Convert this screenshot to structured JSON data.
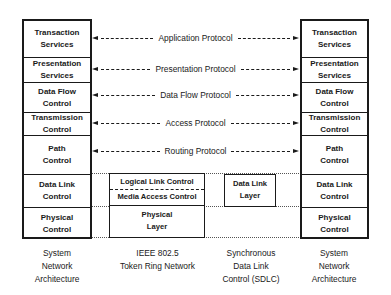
{
  "left_stack": {
    "layers": [
      {
        "label": "Transaction\nServices"
      },
      {
        "label": "Presentation\nServices"
      },
      {
        "label": "Data Flow\nControl"
      },
      {
        "label": "Transmission\nControl"
      },
      {
        "label": "Path\nControl"
      },
      {
        "label": "Data Link\nControl"
      },
      {
        "label": "Physical\nControl"
      }
    ],
    "caption": "System\nNetwork\nArchitecture"
  },
  "right_stack": {
    "layers": [
      {
        "label": "Transaction\nServices"
      },
      {
        "label": "Presentation\nServices"
      },
      {
        "label": "Data Flow\nControl"
      },
      {
        "label": "Transmission\nControl"
      },
      {
        "label": "Path\nControl"
      },
      {
        "label": "Data Link\nControl"
      },
      {
        "label": "Physical\nControl"
      }
    ],
    "caption": "System\nNetwork\nArchitecture"
  },
  "protocols": [
    {
      "label": "Application Protocol"
    },
    {
      "label": "Presentation Protocol"
    },
    {
      "label": "Data Flow Protocol"
    },
    {
      "label": "Access Protocol"
    },
    {
      "label": "Routing Protocol"
    }
  ],
  "token_ring": {
    "upper_top": "Logical Link Control",
    "upper_bottom": "Media Access Control",
    "lower": "Physical\nLayer",
    "caption": "IEEE 802.5\nToken Ring Network"
  },
  "sdlc": {
    "box": "Data Link\nLayer",
    "caption": "Synchronous\nData Link\nControl (SDLC)"
  }
}
